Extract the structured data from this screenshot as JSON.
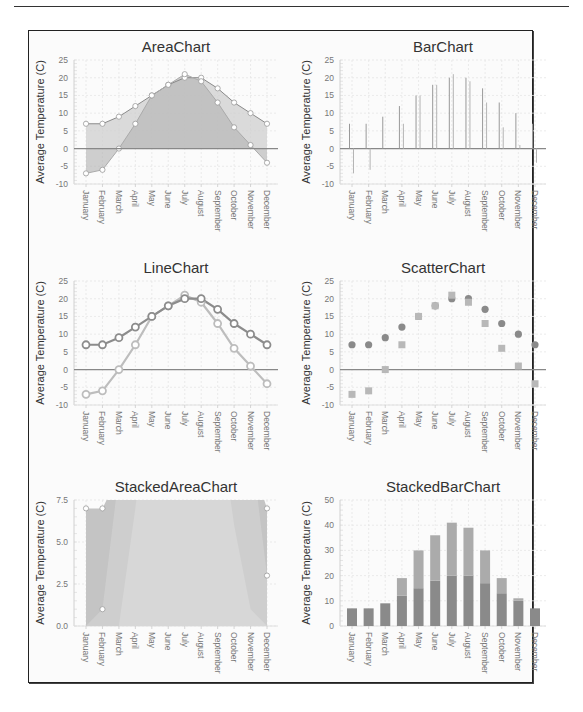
{
  "page": {
    "has_top_rule": true
  },
  "colors": {
    "series_a": "#8a8a8a",
    "series_b": "#bdbdbd",
    "area_a": "#cfcfcf",
    "area_b": "#b5b5b5",
    "zero_line": "#888888",
    "grid": "#e6e6e6"
  },
  "chart_data": [
    {
      "id": "area",
      "type": "area",
      "title": "AreaChart",
      "xlabel": "",
      "ylabel": "Average Temperature (C)",
      "ylim": [
        -10,
        25
      ],
      "yticks": [
        25,
        20,
        15,
        10,
        5,
        0,
        -5,
        -10
      ],
      "categories": [
        "January",
        "February",
        "March",
        "April",
        "May",
        "June",
        "July",
        "August",
        "September",
        "October",
        "November",
        "December"
      ],
      "series": [
        {
          "name": "Series A",
          "values": [
            7,
            7,
            9,
            12,
            15,
            18,
            20,
            20,
            17,
            13,
            10,
            7
          ]
        },
        {
          "name": "Series B",
          "values": [
            -7,
            -6,
            0,
            7,
            15,
            18,
            21,
            19,
            13,
            6,
            1,
            -4
          ]
        }
      ],
      "grid": true
    },
    {
      "id": "bar",
      "type": "bar",
      "title": "BarChart",
      "xlabel": "",
      "ylabel": "Average Temperature (C)",
      "ylim": [
        -10,
        25
      ],
      "yticks": [
        25,
        20,
        15,
        10,
        5,
        0,
        -5,
        -10
      ],
      "categories": [
        "January",
        "February",
        "March",
        "April",
        "May",
        "June",
        "July",
        "August",
        "September",
        "October",
        "November",
        "December"
      ],
      "series": [
        {
          "name": "Series A",
          "values": [
            7,
            7,
            9,
            12,
            15,
            18,
            20,
            20,
            17,
            13,
            10,
            7
          ]
        },
        {
          "name": "Series B",
          "values": [
            -7,
            -6,
            0,
            7,
            15,
            18,
            21,
            19,
            13,
            6,
            1,
            -4
          ]
        }
      ],
      "grid": true
    },
    {
      "id": "line",
      "type": "line",
      "title": "LineChart",
      "xlabel": "",
      "ylabel": "Average Temperature (C)",
      "ylim": [
        -10,
        25
      ],
      "yticks": [
        25,
        20,
        15,
        10,
        5,
        0,
        -5,
        -10
      ],
      "categories": [
        "January",
        "February",
        "March",
        "April",
        "May",
        "June",
        "July",
        "August",
        "September",
        "October",
        "November",
        "December"
      ],
      "series": [
        {
          "name": "Series A",
          "values": [
            7,
            7,
            9,
            12,
            15,
            18,
            20,
            20,
            17,
            13,
            10,
            7
          ]
        },
        {
          "name": "Series B",
          "values": [
            -7,
            -6,
            0,
            7,
            15,
            18,
            21,
            19,
            13,
            6,
            1,
            -4
          ]
        }
      ],
      "grid": true
    },
    {
      "id": "scatter",
      "type": "scatter",
      "title": "ScatterChart",
      "xlabel": "",
      "ylabel": "Average Temperature (C)",
      "ylim": [
        -10,
        25
      ],
      "yticks": [
        25,
        20,
        15,
        10,
        5,
        0,
        -5,
        -10
      ],
      "categories": [
        "January",
        "February",
        "March",
        "April",
        "May",
        "June",
        "July",
        "August",
        "September",
        "October",
        "November",
        "December"
      ],
      "series": [
        {
          "name": "Series A",
          "marker": "circle",
          "values": [
            7,
            7,
            9,
            12,
            15,
            18,
            20,
            20,
            17,
            13,
            10,
            7
          ]
        },
        {
          "name": "Series B",
          "marker": "square",
          "values": [
            -7,
            -6,
            0,
            7,
            15,
            18,
            21,
            19,
            13,
            6,
            1,
            -4
          ]
        }
      ],
      "grid": true
    },
    {
      "id": "stackedarea",
      "type": "area",
      "stacked": true,
      "title": "StackedAreaChart",
      "xlabel": "",
      "ylabel": "Average Temperature (C)",
      "ylim": [
        0,
        7.5
      ],
      "yticks": [
        "7.5",
        "5.0",
        "2.5",
        "0.0"
      ],
      "categories": [
        "January",
        "February",
        "March",
        "April",
        "May",
        "June",
        "July",
        "August",
        "September",
        "October",
        "November",
        "December"
      ],
      "series": [
        {
          "name": "Series A",
          "values": [
            7,
            7,
            9,
            12,
            15,
            18,
            20,
            20,
            17,
            13,
            10,
            7
          ]
        },
        {
          "name": "Series B",
          "values": [
            -7,
            -6,
            0,
            7,
            15,
            18,
            21,
            19,
            13,
            6,
            1,
            -4
          ]
        }
      ],
      "grid": true
    },
    {
      "id": "stackedbar",
      "type": "bar",
      "stacked": true,
      "title": "StackedBarChart",
      "xlabel": "",
      "ylabel": "Average Temperature (C)",
      "ylim": [
        0,
        50
      ],
      "yticks": [
        50,
        40,
        30,
        20,
        10,
        0
      ],
      "categories": [
        "January",
        "February",
        "March",
        "April",
        "May",
        "June",
        "July",
        "August",
        "September",
        "October",
        "November",
        "December"
      ],
      "series": [
        {
          "name": "Series A",
          "values": [
            7,
            7,
            9,
            12,
            15,
            18,
            20,
            20,
            17,
            13,
            10,
            7
          ]
        },
        {
          "name": "Series B",
          "values": [
            -7,
            -6,
            0,
            7,
            15,
            18,
            21,
            19,
            13,
            6,
            1,
            -4
          ]
        }
      ],
      "grid": true
    }
  ]
}
